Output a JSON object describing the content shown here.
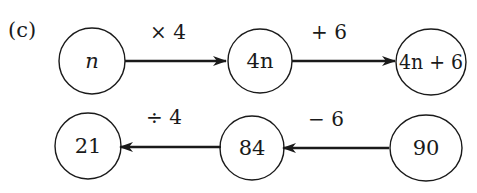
{
  "part_label": "(c)",
  "top_row": {
    "nodes": [
      {
        "label": "n",
        "italic": true
      },
      {
        "label": "4n"
      },
      {
        "label": "4n + 6"
      }
    ],
    "operations": [
      {
        "label": "× 4",
        "direction": "right"
      },
      {
        "label": "+ 6",
        "direction": "right"
      }
    ]
  },
  "bottom_row": {
    "nodes": [
      {
        "label": "21"
      },
      {
        "label": "84"
      },
      {
        "label": "90"
      }
    ],
    "operations": [
      {
        "label": "÷ 4",
        "direction": "left"
      },
      {
        "label": "− 6",
        "direction": "left"
      }
    ]
  },
  "colors": {
    "stroke": "#1a1a1a",
    "background": "#ffffff"
  }
}
